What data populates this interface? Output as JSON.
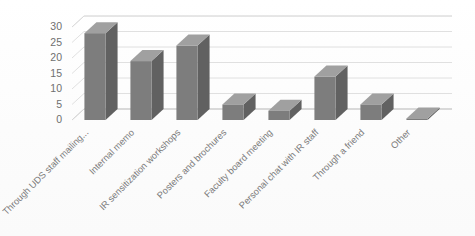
{
  "chart_data": {
    "type": "bar",
    "title": "",
    "subtitle": "",
    "xlabel": "",
    "ylabel": "",
    "ylim": [
      0,
      30
    ],
    "ytick_step": 5,
    "yticks": [
      "0",
      "5",
      "10",
      "15",
      "20",
      "25",
      "30"
    ],
    "grid": true,
    "legend": false,
    "legend_position": "none",
    "style": "3d-column",
    "categories": [
      "Through UDS staff mailing...",
      "Internal memo",
      "IR sensitization workshops",
      "Posters and brochures",
      "Faculty board meeting",
      "Personal chat with IR staff",
      "Through a friend",
      "Other"
    ],
    "values": [
      28,
      19,
      24,
      5,
      3,
      14,
      5,
      0.5
    ],
    "series": [
      {
        "name": "Series 1",
        "values": [
          28,
          19,
          24,
          5,
          3,
          14,
          5,
          0.5
        ]
      }
    ],
    "xtick_rotation": "-45",
    "colors": {
      "bar_front": "#7d7d7d",
      "bar_top": "#a0a0a0",
      "bar_side": "#616161",
      "gridline": "#d8d8d8",
      "axis": "#c9c9c9",
      "tick_text": "#6f6f6f",
      "background": "#fdfdfd"
    }
  }
}
